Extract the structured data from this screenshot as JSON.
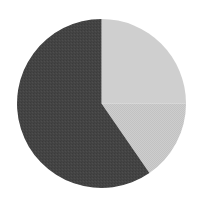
{
  "figure": {
    "background_color": "#ffffff",
    "width": 201,
    "height": 203
  },
  "chart_data": {
    "type": "pie",
    "title": "",
    "subtitle": "",
    "xlabel": "",
    "ylabel": "",
    "legend": false,
    "legend_position": "none",
    "grid": false,
    "labels": [
      "Slice 1",
      "Slice 2",
      "Slice 3"
    ],
    "values": [
      59.6,
      25.0,
      15.4
    ],
    "percentages": [
      "59.6%",
      "25.0%",
      "15.4%"
    ],
    "angles_deg": [
      214.5,
      90.0,
      55.5
    ],
    "start_angle_deg": 90,
    "direction": "clockwise",
    "colors": [
      "#444444",
      "#cfcfcf",
      "#c6c6c6"
    ],
    "explode": [
      0,
      0,
      0
    ],
    "annotations": [],
    "tick_labels": [],
    "radius_px": 84.5,
    "center_px": [
      101.5,
      103.5
    ]
  },
  "geometry": {
    "center_x": 101.5,
    "center_y": 103.5,
    "radius": 84.5
  }
}
